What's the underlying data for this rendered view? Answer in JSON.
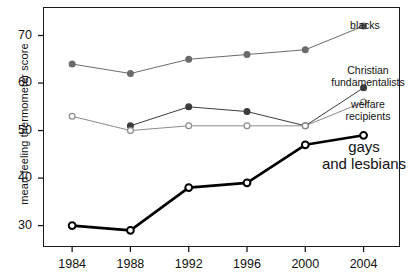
{
  "chart_data": {
    "type": "line",
    "title": "",
    "subtitle": "",
    "xlabel": "",
    "ylabel": "mean feeling thermometer score",
    "categories": [
      "1984",
      "1988",
      "1992",
      "1996",
      "2000",
      "2004"
    ],
    "x": [
      1984,
      1988,
      1992,
      1996,
      2000,
      2004
    ],
    "xlim": [
      1982,
      2006.5
    ],
    "ylim": [
      25.5,
      76
    ],
    "yticks": [
      30,
      40,
      50,
      60,
      70
    ],
    "ytick_labels": [
      "30",
      "40",
      "50",
      "60",
      "70"
    ],
    "xticks": [
      1984,
      1988,
      1992,
      1996,
      2000,
      2004
    ],
    "grid": false,
    "legend": "inline-right-labels",
    "series": [
      {
        "name": "blacks",
        "label": "blacks",
        "marker": "filled-circle",
        "color": "#6b6b6b",
        "linewidth": 1,
        "values": [
          64,
          62,
          65,
          66,
          67,
          72
        ]
      },
      {
        "name": "Christian fundamentalists",
        "label": "Christian\nfundamentalists",
        "label_line1": "Christian",
        "label_line2": "fundamentalists",
        "marker": "filled-circle",
        "color": "#3c3c3c",
        "linewidth": 1,
        "values": [
          null,
          51,
          55,
          54,
          51,
          59
        ]
      },
      {
        "name": "welfare recipients",
        "label": "welfare\nrecipients",
        "label_line1": "welfare",
        "label_line2": "recipients",
        "marker": "open-circle",
        "color": "#8a8a8a",
        "linewidth": 1,
        "values": [
          53,
          50,
          51,
          51,
          51,
          56
        ]
      },
      {
        "name": "gays and lesbians",
        "label": "gays\nand lesbians",
        "label_line1": "gays",
        "label_line2": "and lesbians",
        "marker": "open-circle",
        "color": "#000000",
        "linewidth": 2.6,
        "values": [
          30,
          29,
          38,
          39,
          47,
          49
        ]
      }
    ]
  },
  "axes": {
    "y_label_text": "mean feeling thermometer score",
    "y_ticks": [
      "70",
      "60",
      "50",
      "40",
      "30"
    ],
    "x_ticks": [
      "1984",
      "1988",
      "1992",
      "1996",
      "2000",
      "2004"
    ]
  },
  "annotations": {
    "blacks": "blacks",
    "christian_line1": "Christian",
    "christian_line2": "fundamentalists",
    "welfare_line1": "welfare",
    "welfare_line2": "recipients",
    "gays_line1": "gays",
    "gays_line2": "and lesbians"
  },
  "colors": {
    "frame": "#1a1a1a",
    "blacks": "#6b6b6b",
    "christian": "#3c3c3c",
    "welfare": "#8a8a8a",
    "gays": "#000000",
    "text": "#111111",
    "background": "#ffffff"
  }
}
